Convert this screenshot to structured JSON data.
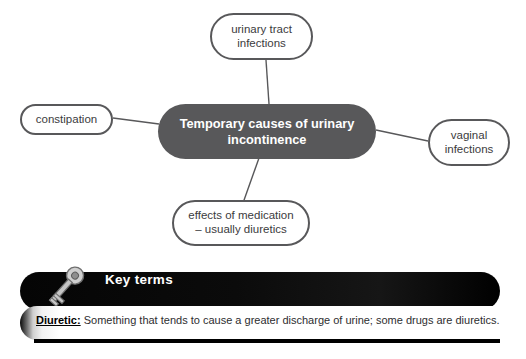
{
  "diagram": {
    "type": "mind-map",
    "center": {
      "label": "Temporary causes of urinary incontinence",
      "line1": "Temporary causes of urinary",
      "line2": "incontinence",
      "fill": "#58585a",
      "text_color": "#ffffff"
    },
    "branches": [
      {
        "id": "urinary-tract-infections",
        "label": "urinary tract infections",
        "line1": "urinary tract",
        "line2": "infections",
        "position": "top"
      },
      {
        "id": "constipation",
        "label": "constipation",
        "line1": "constipation",
        "line2": "",
        "position": "left"
      },
      {
        "id": "vaginal-infections",
        "label": "vaginal infections",
        "line1": "vaginal",
        "line2": "infections",
        "position": "right"
      },
      {
        "id": "effects-of-medication",
        "label": "effects of medication – usually diuretics",
        "line1": "effects of medication",
        "line2": "– usually diuretics",
        "position": "bottom"
      }
    ],
    "node_outline_color": "#58585a",
    "connector_color": "#58585a"
  },
  "key_terms": {
    "title": "Key terms",
    "icon": "key-icon",
    "header_background": "#000000",
    "header_text_color": "#ffffff",
    "entries": [
      {
        "term": "Diuretic:",
        "definition": "Something that tends to cause a greater discharge of urine; some drugs are diuretics."
      }
    ]
  }
}
